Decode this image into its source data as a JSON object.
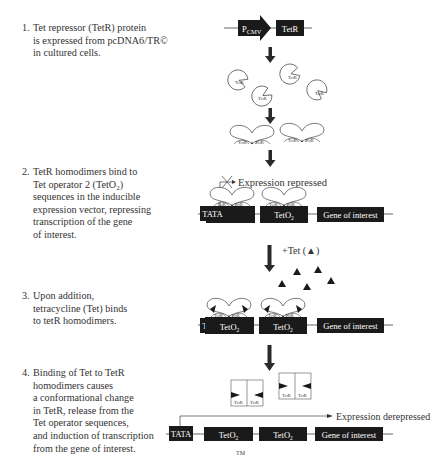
{
  "steps": [
    {
      "num": "1.",
      "text": "Tet repressor (TetR) protein\nis expressed from pcDNA6/TR©\nin cultured cells."
    },
    {
      "num": "2.",
      "text": "TetR homodimers bind to\nTet operator 2 (TetO₂)\nsequences in the inducible\nexpression vector, repressing\ntranscription of the gene\nof interest."
    },
    {
      "num": "3.",
      "text": "Upon addition,\ntetracycline (Tet) binds\nto tetR homodimers."
    },
    {
      "num": "4.",
      "text": "Binding of Tet to TetR\nhomodimers causes\na conformational change\nin TetR, release from the\nTet operator sequences,\nand induction of transcription\nfrom the gene of interest."
    }
  ],
  "diagram": {
    "promoter": {
      "label_main": "P",
      "label_sub": "CMV"
    },
    "tetr_gene": "TetR",
    "tetr_protein": "TetR",
    "tata": "TATA",
    "teto": {
      "main": "TetO",
      "sub": "2"
    },
    "gene": "Gene of interest",
    "expression_repressed": "Expression repressed",
    "expression_derepressed": "Expression derepressed",
    "tet_addition": "+Tet (▲)",
    "footer_mark": "TM"
  },
  "colors": {
    "box_fill": "#1a1a1a",
    "line": "#555555",
    "arrow": "#2a2a2a",
    "text": "#333333"
  }
}
